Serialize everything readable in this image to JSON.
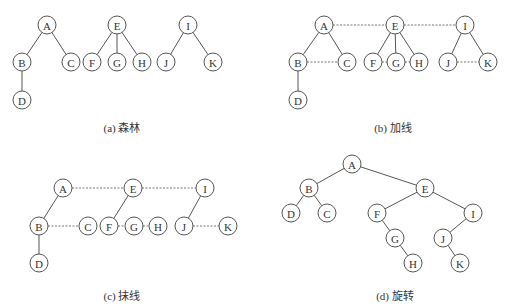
{
  "figure": {
    "node_radius": 9,
    "panels": [
      {
        "id": "a",
        "caption": "(a) 森林",
        "caption_pos": [
          122,
          132
        ],
        "nodes": [
          {
            "label": "A",
            "x": 47,
            "y": 25
          },
          {
            "label": "B",
            "x": 22,
            "y": 62
          },
          {
            "label": "C",
            "x": 71,
            "y": 62
          },
          {
            "label": "D",
            "x": 22,
            "y": 100
          },
          {
            "label": "E",
            "x": 117,
            "y": 25
          },
          {
            "label": "F",
            "x": 92,
            "y": 62
          },
          {
            "label": "G",
            "x": 117,
            "y": 62
          },
          {
            "label": "H",
            "x": 142,
            "y": 62
          },
          {
            "label": "I",
            "x": 188,
            "y": 25
          },
          {
            "label": "J",
            "x": 166,
            "y": 62
          },
          {
            "label": "K",
            "x": 213,
            "y": 62
          }
        ],
        "edges": [
          [
            "A",
            "B"
          ],
          [
            "A",
            "C"
          ],
          [
            "B",
            "D"
          ],
          [
            "E",
            "F"
          ],
          [
            "E",
            "G"
          ],
          [
            "E",
            "H"
          ],
          [
            "I",
            "J"
          ],
          [
            "I",
            "K"
          ]
        ],
        "threads": []
      },
      {
        "id": "b",
        "caption": "(b) 加线",
        "caption_pos": [
          393,
          132
        ],
        "nodes": [
          {
            "label": "A",
            "x": 324,
            "y": 25
          },
          {
            "label": "B",
            "x": 298,
            "y": 62
          },
          {
            "label": "C",
            "x": 347,
            "y": 62
          },
          {
            "label": "D",
            "x": 298,
            "y": 100
          },
          {
            "label": "E",
            "x": 395,
            "y": 25
          },
          {
            "label": "F",
            "x": 373,
            "y": 62
          },
          {
            "label": "G",
            "x": 396,
            "y": 62
          },
          {
            "label": "H",
            "x": 419,
            "y": 62
          },
          {
            "label": "I",
            "x": 465,
            "y": 25
          },
          {
            "label": "J",
            "x": 448,
            "y": 62
          },
          {
            "label": "K",
            "x": 488,
            "y": 62
          }
        ],
        "edges": [
          [
            "A",
            "B"
          ],
          [
            "A",
            "C"
          ],
          [
            "B",
            "D"
          ],
          [
            "E",
            "F"
          ],
          [
            "E",
            "G"
          ],
          [
            "E",
            "H"
          ],
          [
            "I",
            "J"
          ],
          [
            "I",
            "K"
          ]
        ],
        "threads": [
          [
            "A",
            "E"
          ],
          [
            "E",
            "I"
          ],
          [
            "B",
            "C"
          ],
          [
            "F",
            "G"
          ],
          [
            "G",
            "H"
          ],
          [
            "J",
            "K"
          ]
        ]
      },
      {
        "id": "c",
        "caption": "(c) 抹线",
        "caption_pos": [
          122,
          300
        ],
        "nodes": [
          {
            "label": "A",
            "x": 63,
            "y": 188
          },
          {
            "label": "B",
            "x": 39,
            "y": 226
          },
          {
            "label": "C",
            "x": 88,
            "y": 226
          },
          {
            "label": "D",
            "x": 39,
            "y": 263
          },
          {
            "label": "E",
            "x": 133,
            "y": 188
          },
          {
            "label": "F",
            "x": 109,
            "y": 226
          },
          {
            "label": "G",
            "x": 134,
            "y": 226
          },
          {
            "label": "H",
            "x": 158,
            "y": 226
          },
          {
            "label": "I",
            "x": 205,
            "y": 188
          },
          {
            "label": "J",
            "x": 184,
            "y": 226
          },
          {
            "label": "K",
            "x": 228,
            "y": 226
          }
        ],
        "edges": [
          [
            "A",
            "B"
          ],
          [
            "B",
            "D"
          ],
          [
            "E",
            "F"
          ],
          [
            "I",
            "J"
          ]
        ],
        "threads": [
          [
            "A",
            "E"
          ],
          [
            "E",
            "I"
          ],
          [
            "B",
            "C"
          ],
          [
            "F",
            "G"
          ],
          [
            "G",
            "H"
          ],
          [
            "J",
            "K"
          ]
        ]
      },
      {
        "id": "d",
        "caption": "(d) 旋转",
        "caption_pos": [
          395,
          300
        ],
        "nodes": [
          {
            "label": "A",
            "x": 352,
            "y": 164
          },
          {
            "label": "B",
            "x": 309,
            "y": 188
          },
          {
            "label": "D",
            "x": 291,
            "y": 213
          },
          {
            "label": "C",
            "x": 327,
            "y": 213
          },
          {
            "label": "E",
            "x": 425,
            "y": 188
          },
          {
            "label": "F",
            "x": 377,
            "y": 213
          },
          {
            "label": "G",
            "x": 395,
            "y": 238
          },
          {
            "label": "H",
            "x": 413,
            "y": 263
          },
          {
            "label": "I",
            "x": 473,
            "y": 213
          },
          {
            "label": "J",
            "x": 443,
            "y": 238
          },
          {
            "label": "K",
            "x": 460,
            "y": 263
          }
        ],
        "edges": [
          [
            "A",
            "B"
          ],
          [
            "A",
            "E"
          ],
          [
            "B",
            "D"
          ],
          [
            "B",
            "C"
          ],
          [
            "E",
            "F"
          ],
          [
            "E",
            "I"
          ],
          [
            "F",
            "G"
          ],
          [
            "G",
            "H"
          ],
          [
            "I",
            "J"
          ],
          [
            "J",
            "K"
          ]
        ],
        "threads": []
      }
    ]
  }
}
